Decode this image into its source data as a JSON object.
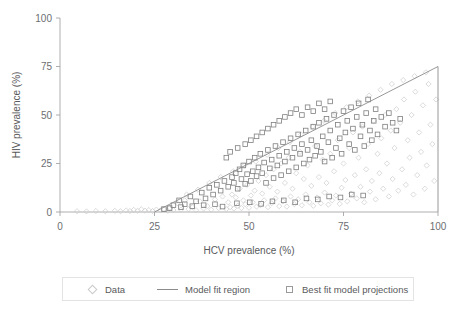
{
  "figure": {
    "background": "#ffffff",
    "axis_color": "#9a9a9a",
    "text_color": "#58595b"
  },
  "axes": {
    "x_title": "HCV prevalence (%)",
    "y_title": "HIV prevalence (%)",
    "x_ticks": [
      "0",
      "25",
      "50",
      "75",
      "100"
    ],
    "y_ticks": [
      "0",
      "25",
      "50",
      "75",
      "100"
    ]
  },
  "legend": {
    "items": [
      {
        "label": "Data",
        "marker": "diamond-icon",
        "color": "#c9c9c9"
      },
      {
        "label": "Model fit region",
        "marker": "line-icon",
        "color": "#8c8c8c"
      },
      {
        "label": "Best fit model projections",
        "marker": "square-icon",
        "color": "#9a9a9a"
      }
    ]
  },
  "chart_data": {
    "type": "scatter",
    "title": "",
    "xlabel": "HCV prevalence (%)",
    "ylabel": "HIV prevalence (%)",
    "xlim": [
      0,
      100
    ],
    "ylim": [
      0,
      100
    ],
    "xticks": [
      0,
      25,
      50,
      75,
      100
    ],
    "yticks": [
      0,
      25,
      50,
      75,
      100
    ],
    "grid": false,
    "legend_position": "below-axes",
    "annotations": [
      {
        "name": "model-fit-region",
        "type": "line",
        "description": "Upper boundary of feasible model fit region: HIV prevalence cannot exceed this line.",
        "points": [
          [
            25,
            0
          ],
          [
            100,
            75
          ],
          [
            100,
            0
          ]
        ],
        "color": "#8c8c8c"
      }
    ],
    "series": [
      {
        "name": "Data",
        "marker": "diamond",
        "color": "#cccccc",
        "points": [
          [
            4.5,
            0.4
          ],
          [
            7.0,
            0.3
          ],
          [
            9.5,
            0.5
          ],
          [
            12.0,
            0.4
          ],
          [
            14.5,
            0.6
          ],
          [
            16.0,
            0.4
          ],
          [
            17.5,
            0.8
          ],
          [
            18.5,
            0.5
          ],
          [
            19.5,
            1.1
          ],
          [
            20.5,
            0.6
          ],
          [
            21.5,
            1.4
          ],
          [
            22.5,
            0.7
          ],
          [
            23.5,
            1.0
          ],
          [
            24.5,
            0.5
          ],
          [
            25.5,
            1.2
          ],
          [
            26.5,
            0.8
          ],
          [
            27.5,
            1.5
          ],
          [
            28.5,
            0.6
          ],
          [
            29.0,
            2.0
          ],
          [
            30.0,
            1.0
          ],
          [
            31.0,
            4.5
          ],
          [
            32.0,
            1.2
          ],
          [
            33.0,
            6.0
          ],
          [
            34.0,
            1.5
          ],
          [
            35.0,
            2.5
          ],
          [
            36.0,
            0.9
          ],
          [
            37.0,
            5.5
          ],
          [
            38.0,
            1.8
          ],
          [
            39.0,
            3.0
          ],
          [
            40.0,
            1.2
          ],
          [
            41.0,
            6.5
          ],
          [
            42.0,
            2.0
          ],
          [
            43.0,
            8.0
          ],
          [
            44.0,
            1.5
          ],
          [
            44.5,
            5.0
          ],
          [
            45.0,
            2.5
          ],
          [
            45.5,
            9.0
          ],
          [
            46.0,
            1.8
          ],
          [
            46.5,
            7.5
          ],
          [
            47.0,
            3.2
          ],
          [
            47.5,
            12.0
          ],
          [
            48.0,
            2.0
          ],
          [
            48.5,
            6.0
          ],
          [
            49.0,
            4.0
          ],
          [
            49.5,
            14.0
          ],
          [
            50.0,
            2.2
          ],
          [
            50.5,
            8.5
          ],
          [
            51.0,
            5.0
          ],
          [
            51.5,
            11.0
          ],
          [
            52.0,
            2.8
          ],
          [
            52.5,
            16.0
          ],
          [
            53.0,
            3.5
          ],
          [
            53.5,
            9.5
          ],
          [
            54.0,
            6.0
          ],
          [
            54.5,
            19.0
          ],
          [
            55.0,
            2.5
          ],
          [
            55.5,
            13.0
          ],
          [
            56.0,
            4.5
          ],
          [
            56.5,
            22.0
          ],
          [
            57.0,
            7.0
          ],
          [
            57.5,
            10.5
          ],
          [
            58.0,
            3.0
          ],
          [
            58.5,
            25.0
          ],
          [
            59.0,
            5.5
          ],
          [
            59.5,
            15.0
          ],
          [
            60.0,
            2.8
          ],
          [
            60.5,
            28.0
          ],
          [
            61.0,
            8.0
          ],
          [
            61.5,
            12.0
          ],
          [
            62.0,
            4.0
          ],
          [
            62.5,
            20.0
          ],
          [
            63.0,
            6.5
          ],
          [
            63.5,
            31.0
          ],
          [
            64.0,
            3.5
          ],
          [
            64.5,
            17.0
          ],
          [
            65.0,
            9.0
          ],
          [
            65.5,
            24.0
          ],
          [
            66.0,
            5.0
          ],
          [
            66.5,
            13.5
          ],
          [
            67.0,
            3.2
          ],
          [
            67.5,
            34.0
          ],
          [
            68.0,
            7.5
          ],
          [
            68.5,
            18.0
          ],
          [
            69.0,
            4.5
          ],
          [
            69.5,
            27.0
          ],
          [
            70.0,
            10.0
          ],
          [
            70.5,
            15.0
          ],
          [
            71.0,
            3.8
          ],
          [
            71.5,
            30.0
          ],
          [
            72.0,
            6.0
          ],
          [
            72.5,
            21.0
          ],
          [
            73.0,
            8.5
          ],
          [
            73.5,
            37.0
          ],
          [
            74.0,
            4.2
          ],
          [
            74.5,
            12.5
          ],
          [
            75.0,
            25.0
          ],
          [
            75.5,
            16.5
          ],
          [
            76.0,
            5.5
          ],
          [
            76.5,
            33.0
          ],
          [
            77.0,
            9.5
          ],
          [
            77.5,
            41.0
          ],
          [
            78.0,
            19.0
          ],
          [
            78.5,
            7.0
          ],
          [
            79.0,
            28.0
          ],
          [
            79.5,
            13.0
          ],
          [
            80.0,
            44.0
          ],
          [
            80.5,
            5.0
          ],
          [
            81.0,
            22.0
          ],
          [
            81.5,
            35.0
          ],
          [
            82.0,
            10.5
          ],
          [
            82.5,
            16.0
          ],
          [
            83.0,
            47.0
          ],
          [
            83.5,
            6.5
          ],
          [
            84.0,
            30.0
          ],
          [
            84.5,
            20.0
          ],
          [
            85.0,
            38.0
          ],
          [
            85.5,
            12.0
          ],
          [
            86.0,
            50.0
          ],
          [
            86.5,
            25.0
          ],
          [
            87.0,
            8.0
          ],
          [
            87.5,
            42.0
          ],
          [
            88.0,
            17.0
          ],
          [
            88.5,
            33.0
          ],
          [
            89.0,
            53.0
          ],
          [
            89.5,
            11.0
          ],
          [
            90.0,
            46.0
          ],
          [
            90.5,
            22.0
          ],
          [
            91.0,
            58.0
          ],
          [
            91.5,
            14.0
          ],
          [
            92.0,
            37.0
          ],
          [
            92.5,
            28.0
          ],
          [
            93.0,
            50.0
          ],
          [
            93.5,
            9.0
          ],
          [
            94.0,
            62.0
          ],
          [
            94.5,
            19.0
          ],
          [
            95.0,
            41.0
          ],
          [
            95.5,
            31.0
          ],
          [
            96.0,
            55.0
          ],
          [
            96.5,
            12.0
          ],
          [
            97.0,
            24.0
          ],
          [
            97.5,
            66.0
          ],
          [
            98.0,
            45.0
          ],
          [
            98.5,
            35.0
          ],
          [
            99.0,
            16.0
          ],
          [
            99.5,
            58.0
          ],
          [
            33.5,
            9.0
          ],
          [
            36.5,
            11.5
          ],
          [
            39.5,
            15.0
          ],
          [
            42.5,
            18.0
          ],
          [
            45.8,
            21.0
          ],
          [
            48.8,
            24.0
          ],
          [
            51.8,
            26.0
          ],
          [
            54.8,
            29.5
          ],
          [
            57.8,
            33.0
          ],
          [
            60.8,
            36.0
          ],
          [
            63.8,
            40.0
          ],
          [
            66.8,
            44.0
          ],
          [
            69.8,
            47.0
          ],
          [
            72.8,
            51.0
          ],
          [
            75.8,
            54.0
          ],
          [
            78.8,
            57.0
          ],
          [
            81.8,
            60.0
          ],
          [
            84.8,
            63.0
          ],
          [
            87.8,
            66.0
          ],
          [
            90.8,
            68.0
          ],
          [
            93.8,
            70.0
          ],
          [
            96.8,
            72.0
          ]
        ]
      },
      {
        "name": "Best fit model projections",
        "marker": "square",
        "color": "#7f7f7f",
        "points": [
          [
            27.5,
            1.5
          ],
          [
            30.0,
            3.5
          ],
          [
            31.5,
            6.0
          ],
          [
            33.0,
            4.0
          ],
          [
            34.5,
            8.0
          ],
          [
            36.0,
            5.5
          ],
          [
            37.5,
            10.0
          ],
          [
            38.5,
            7.0
          ],
          [
            39.5,
            12.5
          ],
          [
            40.5,
            9.0
          ],
          [
            41.5,
            14.0
          ],
          [
            42.5,
            11.0
          ],
          [
            43.5,
            16.0
          ],
          [
            44.5,
            13.0
          ],
          [
            45.5,
            18.0
          ],
          [
            46.0,
            15.0
          ],
          [
            46.5,
            20.0
          ],
          [
            47.0,
            12.0
          ],
          [
            47.5,
            22.0
          ],
          [
            48.0,
            17.0
          ],
          [
            48.5,
            24.0
          ],
          [
            49.0,
            14.5
          ],
          [
            49.5,
            19.5
          ],
          [
            50.0,
            26.0
          ],
          [
            50.5,
            16.0
          ],
          [
            51.0,
            21.0
          ],
          [
            51.5,
            28.0
          ],
          [
            52.0,
            18.5
          ],
          [
            52.5,
            23.0
          ],
          [
            53.0,
            30.0
          ],
          [
            53.5,
            20.0
          ],
          [
            54.0,
            25.5
          ],
          [
            54.5,
            15.0
          ],
          [
            55.0,
            32.0
          ],
          [
            55.5,
            22.5
          ],
          [
            56.0,
            27.0
          ],
          [
            56.5,
            17.5
          ],
          [
            57.0,
            34.0
          ],
          [
            57.5,
            24.0
          ],
          [
            58.0,
            29.0
          ],
          [
            58.5,
            19.0
          ],
          [
            59.0,
            36.0
          ],
          [
            59.5,
            26.0
          ],
          [
            60.0,
            31.0
          ],
          [
            60.5,
            21.0
          ],
          [
            61.0,
            38.0
          ],
          [
            61.5,
            28.0
          ],
          [
            62.0,
            33.0
          ],
          [
            62.5,
            23.0
          ],
          [
            63.0,
            40.0
          ],
          [
            63.5,
            30.0
          ],
          [
            64.0,
            35.0
          ],
          [
            64.5,
            25.0
          ],
          [
            65.0,
            42.0
          ],
          [
            65.5,
            32.0
          ],
          [
            66.0,
            27.0
          ],
          [
            66.5,
            37.0
          ],
          [
            67.0,
            44.0
          ],
          [
            67.5,
            29.0
          ],
          [
            68.0,
            34.0
          ],
          [
            68.5,
            46.0
          ],
          [
            69.0,
            31.0
          ],
          [
            69.5,
            39.0
          ],
          [
            70.0,
            26.0
          ],
          [
            70.5,
            48.0
          ],
          [
            71.0,
            36.0
          ],
          [
            71.5,
            42.0
          ],
          [
            72.0,
            28.0
          ],
          [
            72.5,
            50.0
          ],
          [
            73.0,
            33.0
          ],
          [
            73.5,
            45.0
          ],
          [
            74.0,
            38.0
          ],
          [
            74.5,
            30.0
          ],
          [
            75.0,
            52.0
          ],
          [
            75.5,
            41.0
          ],
          [
            76.0,
            47.0
          ],
          [
            76.5,
            35.0
          ],
          [
            77.0,
            54.0
          ],
          [
            77.5,
            43.0
          ],
          [
            78.0,
            32.0
          ],
          [
            78.5,
            49.0
          ],
          [
            79.0,
            56.0
          ],
          [
            79.5,
            39.0
          ],
          [
            80.0,
            45.0
          ],
          [
            80.5,
            34.0
          ],
          [
            81.0,
            51.0
          ],
          [
            81.5,
            58.0
          ],
          [
            82.0,
            42.0
          ],
          [
            82.5,
            37.0
          ],
          [
            83.0,
            47.0
          ],
          [
            83.5,
            53.0
          ],
          [
            84.0,
            40.0
          ],
          [
            85.0,
            49.0
          ],
          [
            86.0,
            44.0
          ],
          [
            87.0,
            51.0
          ],
          [
            88.0,
            46.0
          ],
          [
            89.0,
            42.0
          ],
          [
            90.0,
            48.0
          ],
          [
            44.0,
            28.0
          ],
          [
            45.0,
            31.0
          ],
          [
            47.0,
            33.0
          ],
          [
            49.0,
            35.0
          ],
          [
            50.5,
            37.0
          ],
          [
            52.0,
            39.0
          ],
          [
            53.5,
            41.0
          ],
          [
            55.0,
            43.0
          ],
          [
            56.5,
            45.0
          ],
          [
            58.0,
            47.0
          ],
          [
            59.5,
            49.0
          ],
          [
            61.0,
            51.0
          ],
          [
            62.5,
            53.0
          ],
          [
            64.0,
            50.0
          ],
          [
            65.5,
            54.0
          ],
          [
            67.0,
            52.0
          ],
          [
            68.5,
            56.0
          ],
          [
            70.0,
            53.0
          ],
          [
            71.5,
            57.0
          ],
          [
            29.0,
            2.0
          ],
          [
            32.0,
            2.5
          ],
          [
            35.0,
            3.0
          ],
          [
            38.0,
            3.5
          ],
          [
            41.0,
            4.0
          ],
          [
            43.0,
            2.8
          ],
          [
            46.8,
            4.5
          ],
          [
            50.2,
            5.0
          ],
          [
            53.2,
            4.2
          ],
          [
            56.2,
            5.5
          ],
          [
            59.2,
            6.0
          ],
          [
            62.2,
            5.0
          ],
          [
            65.2,
            7.0
          ],
          [
            68.2,
            6.5
          ],
          [
            71.2,
            8.0
          ],
          [
            74.2,
            7.5
          ],
          [
            77.2,
            9.0
          ],
          [
            80.2,
            8.5
          ]
        ]
      }
    ]
  }
}
